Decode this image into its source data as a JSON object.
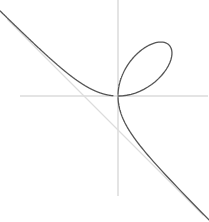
{
  "figure": {
    "width": 209,
    "height": 222,
    "background_color": "#ffffff",
    "title": "",
    "caption": ""
  },
  "chart_data": {
    "type": "line",
    "title": "",
    "subtitle": "",
    "xlabel": "",
    "ylabel": "",
    "grid": false,
    "legend": null,
    "legend_position": "none",
    "axis_style": {
      "color": "#c9c9c9",
      "width": 1,
      "ticks": false,
      "tick_labels": false,
      "spines": "crossed-at-origin"
    },
    "xlim": [
      -3.3,
      2.2
    ],
    "ylim": [
      -2.9,
      2.6
    ],
    "origin_px": [
      118,
      96
    ],
    "scale_px_per_unit": [
      34,
      34
    ],
    "series": [
      {
        "name": "folium-of-descartes",
        "equation": "x^3 + y^3 = 3*a*x*y",
        "parameter_a": 1,
        "color": "#555555",
        "width": 1.3,
        "style": "solid",
        "parametric_form": "x = 3at/(1+t^3), y = 3at^2/(1+t^3)",
        "t_range": [
          -10.5,
          10.5
        ],
        "x": [
          -3.05,
          -2.7,
          -2.35,
          -2.0,
          -1.7,
          -1.4,
          -1.1,
          -0.8,
          -0.5,
          -0.2,
          0.0,
          0.3,
          0.6,
          0.9,
          1.15,
          1.31,
          1.42,
          1.5,
          1.48,
          1.42,
          1.31,
          1.15,
          0.9,
          0.6,
          0.3,
          0.0,
          -0.2,
          -0.5,
          -0.8,
          -1.1,
          -1.4,
          -1.7,
          -2.0,
          -2.35,
          -2.7,
          -3.05
        ],
        "y": [
          2.05,
          1.72,
          1.4,
          1.1,
          0.86,
          0.64,
          0.44,
          0.27,
          0.13,
          0.03,
          0.0,
          0.09,
          0.33,
          0.72,
          1.08,
          1.31,
          1.48,
          1.5,
          1.42,
          1.31,
          1.15,
          0.9,
          0.6,
          0.3,
          0.09,
          0.0,
          -0.2,
          -0.5,
          -0.8,
          -1.1,
          -1.4,
          -1.7,
          -2.0,
          -2.35,
          -2.7,
          -3.05
        ],
        "self_intersection_point": [
          0,
          0
        ],
        "loop_apex": [
          1.42,
          1.42
        ],
        "loop_extent_x": [
          0.0,
          1.95
        ],
        "loop_extent_y": [
          0.0,
          1.95
        ]
      },
      {
        "name": "asymptote",
        "equation": "x + y + a = 0",
        "color": "#dcdcdc",
        "width": 1,
        "style": "solid",
        "x": [
          -3.25,
          2.5
        ],
        "y": [
          2.25,
          -3.5
        ]
      }
    ],
    "annotations": []
  }
}
